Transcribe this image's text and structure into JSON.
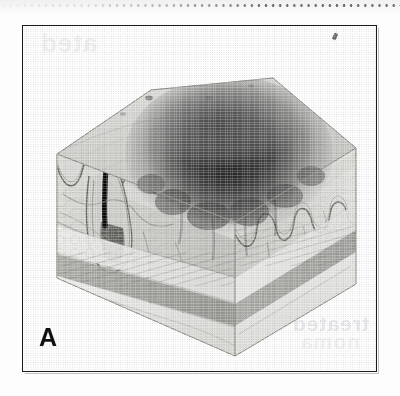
{
  "figure": {
    "panel_label": "A",
    "caption_visible": false,
    "frame_color": "#1b1b1b",
    "background_color": "#fdfdfd"
  },
  "illustration": {
    "title": "skin-block-cutaway",
    "view": "isometric cube cutaway, top surface plus front-left and front-right cut faces",
    "palette": {
      "paper": "#fbfbfa",
      "top_surface_light": "#d9d9d7",
      "top_surface_mid": "#b9b9b6",
      "left_face": "#cfcfcc",
      "right_face": "#c4c4c1",
      "epidermis_line": "#6f6f6c",
      "lesion_dark": "#3a3a3a",
      "lesion_core": "#262626",
      "hair_shaft": "#151515",
      "fat_layer": "#e6e6e3",
      "muscle_layer": "#9a9a96",
      "vessel_line": "#7a7a76"
    },
    "structures": [
      {
        "name": "hair-shaft",
        "label": "hair shaft emerging from follicle"
      },
      {
        "name": "hair-follicle",
        "label": "hair follicle with bulb"
      },
      {
        "name": "epidermis",
        "label": "epidermis with rete ridges"
      },
      {
        "name": "dermal-epidermal-junction",
        "label": "wavy dermal-epidermal junction"
      },
      {
        "name": "pigmented-lesion",
        "label": "dark pigmented melanocytic lesion dome"
      },
      {
        "name": "lesion-nests",
        "label": "nests of pigmented cells at the junction"
      },
      {
        "name": "dermis",
        "label": "dermis with collagen bundles"
      },
      {
        "name": "blood-vessels",
        "label": "dermal vascular plexus"
      },
      {
        "name": "subcutaneous-fat",
        "label": "subcutaneous fat layer"
      },
      {
        "name": "muscle",
        "label": "underlying striated muscle"
      },
      {
        "name": "skin-pores",
        "label": "pore openings on skin surface"
      }
    ]
  },
  "artifacts": {
    "top_dot_row": "row of scanner dots along the top edge",
    "bleed_through_right": "faint mirrored text bleeding through from reverse page",
    "bleed_through_top": "faint mirrored text bleeding through near top-left",
    "pen_mark": "small stray pen tick near the top-right inside the frame",
    "bleed_text_a": "ated",
    "bleed_text_b": "treated",
    "bleed_text_c": "noma"
  }
}
